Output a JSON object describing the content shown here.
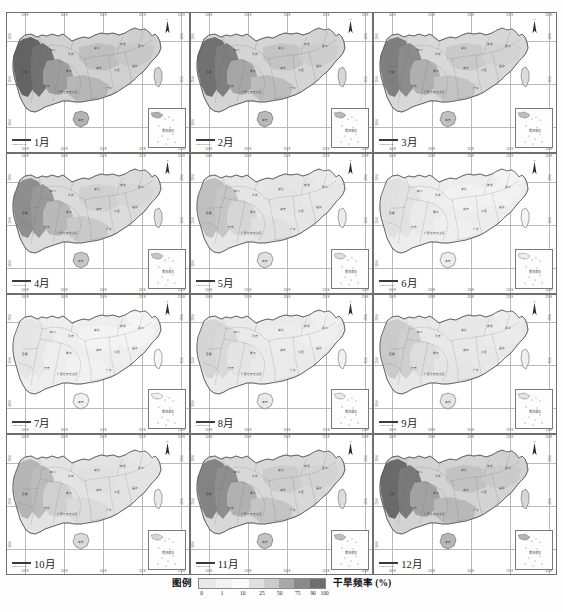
{
  "figure": {
    "kind": "map-grid",
    "title_visible": false,
    "rows": 4,
    "cols": 3,
    "region_name": "中国南方",
    "projection_note": "graticule with degree ticks"
  },
  "panels": [
    {
      "id": "p1",
      "label": "1月",
      "month": 1,
      "row": 0,
      "col": 0,
      "scalebar": "0 250 500 km",
      "severity": 0.86
    },
    {
      "id": "p2",
      "label": "2月",
      "month": 2,
      "row": 0,
      "col": 1,
      "scalebar": "0 250 500 km",
      "severity": 0.78
    },
    {
      "id": "p3",
      "label": "3月",
      "month": 3,
      "row": 0,
      "col": 2,
      "scalebar": "0 250 500 km",
      "severity": 0.7
    },
    {
      "id": "p4",
      "label": "4月",
      "month": 4,
      "row": 1,
      "col": 0,
      "scalebar": "0 250 500 km",
      "severity": 0.62
    },
    {
      "id": "p5",
      "label": "5月",
      "month": 5,
      "row": 1,
      "col": 1,
      "scalebar": "0 250 500 km",
      "severity": 0.34
    },
    {
      "id": "p6",
      "label": "6月",
      "month": 6,
      "row": 1,
      "col": 2,
      "scalebar": "0 250 500 km",
      "severity": 0.16
    },
    {
      "id": "p7",
      "label": "7月",
      "month": 7,
      "row": 2,
      "col": 0,
      "scalebar": "0 250 500 km",
      "severity": 0.13
    },
    {
      "id": "p8",
      "label": "8月",
      "month": 8,
      "row": 2,
      "col": 1,
      "scalebar": "0 250 500 km",
      "severity": 0.22
    },
    {
      "id": "p9",
      "label": "9月",
      "month": 9,
      "row": 2,
      "col": 2,
      "scalebar": "0 250 500 km",
      "severity": 0.28
    },
    {
      "id": "p10",
      "label": "10月",
      "month": 10,
      "row": 3,
      "col": 0,
      "scalebar": "0 250 500 km",
      "severity": 0.4
    },
    {
      "id": "p11",
      "label": "11月",
      "month": 11,
      "row": 3,
      "col": 1,
      "scalebar": "0 250 500 km",
      "severity": 0.68
    },
    {
      "id": "p12",
      "label": "12月",
      "month": 12,
      "row": 3,
      "col": 2,
      "scalebar": "0 250 500 km",
      "severity": 0.82
    }
  ],
  "legend": {
    "title": "图例",
    "unit_label": "干旱频率 (%)",
    "ticks": [
      "0",
      "1",
      "10",
      "25",
      "50",
      "75",
      "90",
      "100"
    ],
    "tick_values": [
      0,
      1,
      10,
      25,
      50,
      75,
      90,
      100
    ],
    "class_colors": [
      "#e9e9e9",
      "#f2f2f2",
      "#fbfbfb",
      "#e0e0e0",
      "#cccccc",
      "#a8a8a8",
      "#8a8a8a",
      "#6e6e6e"
    ],
    "colormap": "grayscale"
  },
  "chart_data": {
    "type": "heatmap",
    "title": "干旱频率 (%)",
    "colorbar_label": "干旱频率 (%)",
    "colorbar_ticks": [
      0,
      1,
      10,
      25,
      50,
      75,
      90,
      100
    ],
    "panel_labels": [
      "1月",
      "2月",
      "3月",
      "4月",
      "5月",
      "6月",
      "7月",
      "8月",
      "9月",
      "10月",
      "11月",
      "12月"
    ],
    "grid": "on",
    "legend_position": "bottom"
  },
  "axes": {
    "lon_ticks": [
      "100°E",
      "105°E",
      "110°E",
      "115°E",
      "120°E"
    ],
    "lat_ticks": [
      "20°N",
      "25°N",
      "30°N"
    ]
  },
  "map_features": {
    "north_arrow": "N",
    "inset_name": "南海诸岛",
    "provinces": [
      "西藏",
      "四川",
      "重庆",
      "云南",
      "贵州",
      "湖北",
      "湖南",
      "江西",
      "安徽",
      "浙江",
      "福建",
      "广东",
      "广西壮族自治区",
      "海南",
      "台湾",
      "江苏",
      "上海"
    ]
  }
}
